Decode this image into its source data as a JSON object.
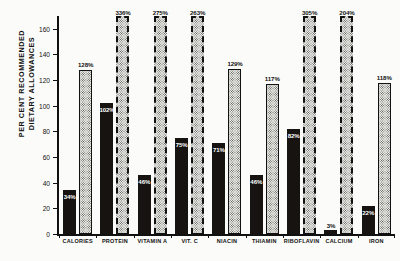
{
  "chart_data": {
    "type": "bar",
    "title": "",
    "xlabel": "",
    "ylabel": "PER CENT RECOMMENDED\nDIETARY ALLOWANCES",
    "ylim": [
      0,
      170
    ],
    "yticks": [
      0,
      20,
      40,
      60,
      80,
      100,
      120,
      140,
      160
    ],
    "grid": false,
    "legend": "none",
    "axis_clip_note": "Bars above the axis maximum are drawn with dashed tops",
    "categories": [
      "CALORIES",
      "PROTEIN",
      "VITAMIN A",
      "VIT. C",
      "NIACIN",
      "THIAMIN",
      "RIBOFLAVIN",
      "CALCIUM",
      "IRON"
    ],
    "series": [
      {
        "name": "solid",
        "values": [
          34,
          102,
          46,
          75,
          71,
          46,
          82,
          3,
          22
        ],
        "labels": [
          "34%",
          "102%",
          "46%",
          "75%",
          "71%",
          "46%",
          "82%",
          "3%",
          "22%"
        ],
        "clipped": [
          false,
          false,
          false,
          false,
          false,
          false,
          false,
          false,
          false
        ]
      },
      {
        "name": "stipple",
        "values": [
          128,
          336,
          275,
          263,
          129,
          117,
          305,
          204,
          118
        ],
        "labels": [
          "128%",
          "336%",
          "275%",
          "263%",
          "129%",
          "117%",
          "305%",
          "204%",
          "118%"
        ],
        "clipped": [
          false,
          true,
          true,
          true,
          false,
          false,
          true,
          true,
          false
        ]
      }
    ]
  }
}
